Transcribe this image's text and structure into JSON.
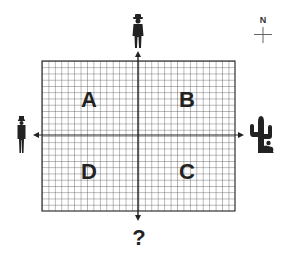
{
  "diagram": {
    "quadrants": [
      {
        "id": "A",
        "label": "A",
        "position": "upper-left"
      },
      {
        "id": "B",
        "label": "B",
        "position": "upper-right"
      },
      {
        "id": "C",
        "label": "C",
        "position": "lower-right"
      },
      {
        "id": "D",
        "label": "D",
        "position": "lower-left"
      }
    ],
    "compass": {
      "label": "N"
    },
    "bottom_marker": {
      "label": "?"
    },
    "figures": {
      "top": "cowboy-figure-icon",
      "left": "person-in-hat-figure-icon",
      "right": "cactus-with-crouching-figure-icon"
    },
    "grid": {
      "columns": 30,
      "rows": 24
    },
    "colors": {
      "ink": "#222222",
      "grid_line": "#555555",
      "background": "#ffffff"
    }
  }
}
